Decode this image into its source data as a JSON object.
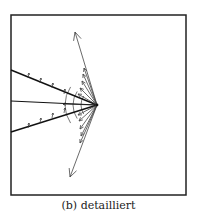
{
  "figure": {
    "caption": "(b) detailliert",
    "frame": {
      "x": 11,
      "y": 15,
      "width": 175,
      "height": 180,
      "stroke": "#222222"
    },
    "apex": {
      "x": 97,
      "y": 105
    },
    "wedge_lines": [
      {
        "x1": 11,
        "y1": 70,
        "x2": 97,
        "y2": 105,
        "width": 1.4
      },
      {
        "x1": 11,
        "y1": 101,
        "x2": 97,
        "y2": 105,
        "width": 1.0
      },
      {
        "x1": 11,
        "y1": 132,
        "x2": 97,
        "y2": 105,
        "width": 1.4
      }
    ],
    "long_arrows": [
      {
        "x1": 97,
        "y1": 105,
        "x2": 75,
        "y2": 32
      },
      {
        "x1": 97,
        "y1": 105,
        "x2": 70,
        "y2": 177
      }
    ],
    "nested_arrows_up": [
      {
        "x1": 97,
        "y1": 105,
        "x2": 84,
        "y2": 68
      },
      {
        "x1": 97,
        "y1": 105,
        "x2": 83,
        "y2": 74
      },
      {
        "x1": 97,
        "y1": 105,
        "x2": 82,
        "y2": 81
      },
      {
        "x1": 97,
        "y1": 105,
        "x2": 80,
        "y2": 88
      },
      {
        "x1": 97,
        "y1": 105,
        "x2": 78,
        "y2": 94
      }
    ],
    "nested_arrows_down": [
      {
        "x1": 97,
        "y1": 105,
        "x2": 80,
        "y2": 143
      },
      {
        "x1": 97,
        "y1": 105,
        "x2": 81,
        "y2": 136
      },
      {
        "x1": 97,
        "y1": 105,
        "x2": 80,
        "y2": 129
      },
      {
        "x1": 97,
        "y1": 105,
        "x2": 79,
        "y2": 121
      },
      {
        "x1": 97,
        "y1": 105,
        "x2": 78,
        "y2": 115
      }
    ],
    "tick_marks_upper": [
      [
        28,
        76
      ],
      [
        40,
        81
      ],
      [
        52,
        86
      ],
      [
        64,
        92
      ]
    ],
    "tick_marks_lower": [
      [
        28,
        126
      ],
      [
        40,
        121
      ],
      [
        52,
        116
      ],
      [
        64,
        111
      ]
    ],
    "arcs": [
      {
        "cx": 97,
        "cy": 105,
        "r": 32
      },
      {
        "cx": 97,
        "cy": 105,
        "r": 24
      },
      {
        "cx": 97,
        "cy": 105,
        "r": 16
      }
    ],
    "inner_arrow": {
      "x1": 97,
      "y1": 105,
      "x2": 63,
      "y2": 104
    }
  }
}
